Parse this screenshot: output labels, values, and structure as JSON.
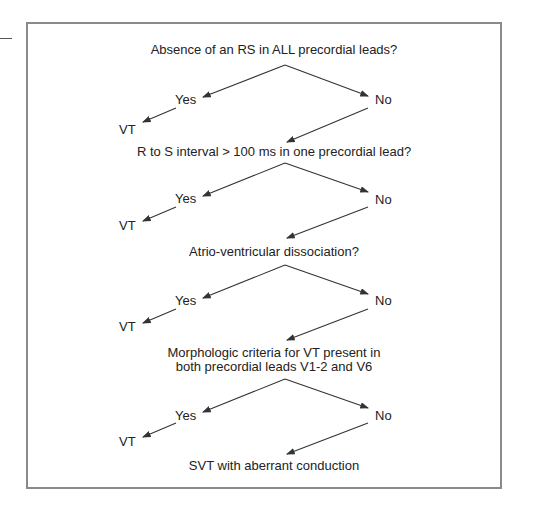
{
  "diagram": {
    "nodes": {
      "q1": "Absence of an RS in ALL precordial leads?",
      "q2": "R to S interval > 100 ms in one precordial lead?",
      "q3": "Atrio-ventricular dissociation?",
      "q4_line1": "Morphologic criteria for VT present in",
      "q4_line2": "both precordial leads V1-2 and V6",
      "end": "SVT with aberrant conduction"
    },
    "branches": [
      {
        "yes": "Yes",
        "no": "No",
        "result": "VT"
      },
      {
        "yes": "Yes",
        "no": "No",
        "result": "VT"
      },
      {
        "yes": "Yes",
        "no": "No",
        "result": "VT"
      },
      {
        "yes": "Yes",
        "no": "No",
        "result": "VT"
      }
    ],
    "colors": {
      "border": "#8a8a8a",
      "line": "#333333",
      "text": "#222222"
    }
  }
}
